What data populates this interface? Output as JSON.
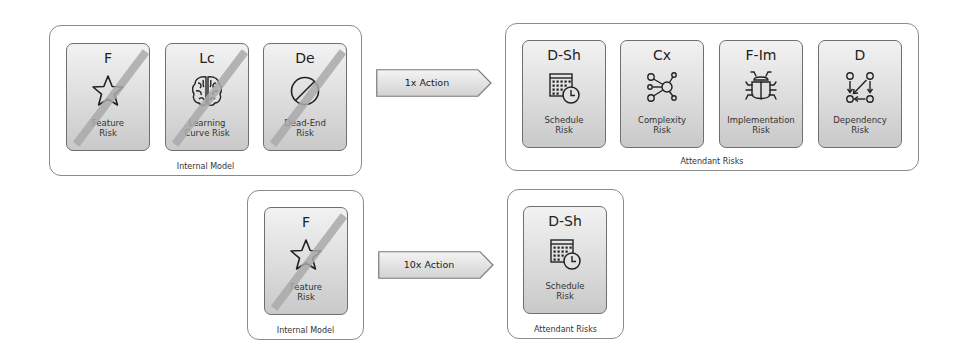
{
  "top_row": {
    "internal_model": {
      "label": "Internal Model",
      "cards": [
        {
          "code": "F",
          "name_line1": "Feature",
          "name_line2": "Risk",
          "icon": "star-icon",
          "struck": true
        },
        {
          "code": "Lc",
          "name_line1": "Learning",
          "name_line2": "Curve Risk",
          "icon": "brain-icon",
          "struck": true
        },
        {
          "code": "De",
          "name_line1": "Dead-End",
          "name_line2": "Risk",
          "icon": "prohibited-icon",
          "struck": true
        }
      ]
    },
    "action": {
      "label": "1x Action"
    },
    "attendant_risks": {
      "label": "Attendant Risks",
      "cards": [
        {
          "code": "D-Sh",
          "name_line1": "Schedule",
          "name_line2": "Risk",
          "icon": "calendar-clock-icon"
        },
        {
          "code": "Cx",
          "name_line1": "Complexity",
          "name_line2": "Risk",
          "icon": "network-icon"
        },
        {
          "code": "F-Im",
          "name_line1": "Implementation",
          "name_line2": "Risk",
          "icon": "bug-icon"
        },
        {
          "code": "D",
          "name_line1": "Dependency",
          "name_line2": "Risk",
          "icon": "dependency-graph-icon"
        }
      ]
    }
  },
  "bottom_row": {
    "internal_model": {
      "label": "Internal Model",
      "cards": [
        {
          "code": "F",
          "name_line1": "Feature",
          "name_line2": "Risk",
          "icon": "star-icon",
          "struck": true
        }
      ]
    },
    "action": {
      "label": "10x Action"
    },
    "attendant_risks": {
      "label": "Attendant Risks",
      "cards": [
        {
          "code": "D-Sh",
          "name_line1": "Schedule",
          "name_line2": "Risk",
          "icon": "calendar-clock-icon"
        }
      ]
    }
  },
  "colors": {
    "card_border": "#6f6f6f",
    "group_border": "#8a8a8a",
    "strike": "#a9a9a9",
    "icon_stroke": "#222222"
  }
}
